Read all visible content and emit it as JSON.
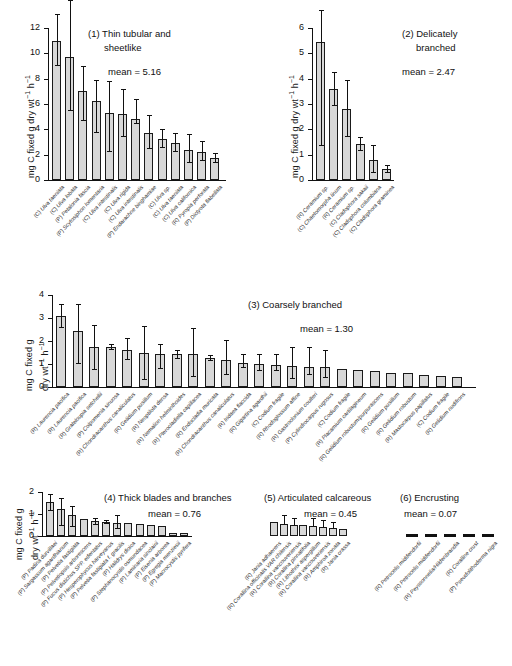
{
  "axis": {
    "ylabel_line1": "mg C fixed g dry wt",
    "ylabel_line2": "mg C fixed g",
    "ylabel_line3": "dry wt",
    "ylabel_full": "mg C fixed g dry wt-1 h-1"
  },
  "chart_data": {
    "type": "bar",
    "ylabel": "mg C fixed g dry wt⁻¹ h⁻¹",
    "xlabel": "",
    "grid": false,
    "legend": "none",
    "panels": [
      {
        "id": 1,
        "title": "(1) Thin tubular and sheetlike",
        "title_lines": [
          "(1) Thin tubular and",
          "sheetlike"
        ],
        "mean_label": "mean = 5.16",
        "mean": 5.16,
        "ylim": [
          0,
          12
        ],
        "yticks": [
          0,
          2,
          4,
          6,
          8,
          10,
          12
        ],
        "categories": [
          "(C) Ulva taeniata",
          "(C) Ulva lobata",
          "(P) Petalonia fascia",
          "(P) Scytosiphon lomentaria",
          "(C) Ulva intestinalis",
          "(C) Ulva rigida",
          "(C) Ulva intestinalis",
          "(P) Endarachne binghamiae",
          "(C) Ulva sp.",
          "(C) Ulva taeniata",
          "(C) Ulva californica",
          "(R) Pyropia perforata",
          "(P) Dictyota flabellata"
        ],
        "values": [
          11.0,
          9.75,
          7.05,
          6.25,
          5.3,
          5.2,
          4.85,
          3.7,
          3.25,
          2.9,
          2.4,
          2.2,
          1.75
        ],
        "err_low": [
          9.1,
          5.5,
          4.75,
          3.8,
          2.3,
          3.5,
          4.5,
          2.5,
          2.6,
          2.3,
          1.45,
          1.55,
          1.45
        ],
        "err_high": [
          13.1,
          14.2,
          9.0,
          7.9,
          7.8,
          7.2,
          6.4,
          5.1,
          4.0,
          3.7,
          3.6,
          3.1,
          2.1
        ]
      },
      {
        "id": 2,
        "title": "(2) Delicately branched",
        "title_lines": [
          "(2) Delicately",
          "branched"
        ],
        "mean_label": "mean = 2.47",
        "mean": 2.47,
        "ylim": [
          0,
          6
        ],
        "yticks": [
          0,
          1,
          2,
          3,
          4,
          5,
          6
        ],
        "categories": [
          "(R) Ceramium sp.",
          "(C) Chaetomorpha linum",
          "(R) Ceramium sp.",
          "(C) Cladophora sakaii",
          "(C) Cladophora columbiana",
          "(C) Cladophora graminea"
        ],
        "values": [
          5.45,
          3.6,
          2.8,
          1.42,
          0.8,
          0.45
        ],
        "err_low": [
          1.4,
          2.95,
          1.75,
          1.2,
          0.3,
          0.32
        ],
        "err_high": [
          6.7,
          4.25,
          3.95,
          1.68,
          1.4,
          0.58
        ]
      },
      {
        "id": 3,
        "title": "(3) Coarsely branched",
        "title_lines": [
          "(3) Coarsely branched"
        ],
        "mean_label": "mean = 1.30",
        "mean": 1.3,
        "ylim": [
          0,
          4
        ],
        "yticks": [
          0,
          1,
          2,
          3,
          4
        ],
        "categories": [
          "(R) Laurencia pacifica",
          "(R) Laurencia pacifica",
          "(R) Grateloupia setchellii",
          "(P) Colpomenia sinuosa",
          "(R) Chondracanthus canaliculatus",
          "(R) Gelidium pusillum",
          "(R) Neoptilota densa",
          "(R) Nemalion helminthoides",
          "(R) Pterocladiella capillacea",
          "(R) Endocladia muricata",
          "(R) Chondracanthus canaliculatus",
          "(R) Iridaea flaccida",
          "(R) Gigartina agardhii",
          "(C) Codium fragile",
          "(R) Rhodoglossum affine",
          "(R) Gastroclonium coulteri",
          "(P) Cylindrocarpus rugosus",
          "(C) Codium fragile",
          "(R) Placamium cartilagineum",
          "(R) Gelidium robustum/purpurascens",
          "(R) Gelidium pusillum",
          "(R) Gelidium robustum",
          "(R) Mastocarpus papillatus",
          "(C) Codium fragile",
          "(R) Gelidium nudifrons"
        ],
        "values": [
          3.1,
          2.42,
          1.75,
          1.75,
          1.62,
          1.5,
          1.45,
          1.45,
          1.42,
          1.28,
          1.18,
          1.05,
          1.0,
          0.95,
          0.9,
          0.88,
          0.85,
          0.78,
          0.72,
          0.7,
          0.62,
          0.6,
          0.52,
          0.48,
          0.42
        ],
        "err_low": [
          2.6,
          1.05,
          0.78,
          1.65,
          1.2,
          0.35,
          0.82,
          1.25,
          0.48,
          1.18,
          0.55,
          0.85,
          0.72,
          0.75,
          0.4,
          0.55,
          0.42,
          0.78,
          0.72,
          0.7,
          0.62,
          0.6,
          0.52,
          0.48,
          0.42
        ],
        "err_high": [
          3.62,
          3.6,
          2.7,
          1.85,
          2.15,
          2.65,
          1.88,
          1.6,
          2.58,
          1.38,
          2.05,
          1.42,
          1.42,
          1.42,
          1.75,
          1.75,
          1.6,
          0.78,
          0.72,
          0.7,
          0.62,
          0.6,
          0.52,
          0.48,
          0.42
        ]
      },
      {
        "id": 4,
        "title": "(4) Thick blades and branches",
        "title_lines": [
          "(4) Thick blades and branches"
        ],
        "mean_label": "mean = 0.76",
        "mean": 0.76,
        "ylim": [
          0,
          2
        ],
        "yticks": [
          0,
          1,
          2
        ],
        "categories": [
          "(P) Padina durvillaei",
          "(P) Sargassum agardhianum",
          "(P) Pelvetia fastigiata",
          "(P) Pelvetiopsis arborescens",
          "(P) Fucus distichus SPP. edentatus",
          "(P) Hesperophycus harveyanus",
          "(P) Pelvetia fastigiata f. gracilis",
          "(P) Halidrys dioica",
          "(P) Stephanocystis osmundacea",
          "(P) Laminaria sinclairii",
          "(P) Eisenia arborea",
          "(P) Egregia menziesii",
          "(P) Macrocystis pyrifera"
        ],
        "values": [
          1.55,
          1.25,
          0.95,
          0.78,
          0.7,
          0.65,
          0.6,
          0.58,
          0.55,
          0.5,
          0.45,
          0.12,
          0.12
        ],
        "err_low": [
          1.2,
          0.5,
          0.45,
          0.78,
          0.55,
          0.58,
          0.35,
          0.58,
          0.55,
          0.5,
          0.45,
          0.12,
          0.12
        ],
        "err_high": [
          1.9,
          1.75,
          1.35,
          0.78,
          0.8,
          0.72,
          0.95,
          0.58,
          0.55,
          0.5,
          0.45,
          0.12,
          0.12
        ]
      },
      {
        "id": 5,
        "title": "(5) Articulated calcareous",
        "title_lines": [
          "(5) Articulated calcareous"
        ],
        "mean_label": "mean = 0.45",
        "mean": 0.45,
        "ylim": [
          0,
          2
        ],
        "yticks": [],
        "categories": [
          "(R) Jania adhaerens",
          "(R) Corallina officinalis VAR chilensis",
          "(R) Corallina vancouveriensis",
          "(R) Corallina pinnatifolia",
          "(R) Lithothrix aspergillum",
          "(R) Corallina vancouveriensis",
          "(R) Amphiroa zonata",
          "(R) Jania crassa"
        ],
        "values": [
          0.62,
          0.55,
          0.5,
          0.48,
          0.45,
          0.42,
          0.38,
          0.32
        ],
        "err_low": [
          0.62,
          0.55,
          0.5,
          0.48,
          0.45,
          0.42,
          0.38,
          0.32
        ],
        "err_high": [
          0.62,
          0.95,
          0.8,
          0.48,
          0.82,
          0.75,
          0.62,
          0.32
        ]
      },
      {
        "id": 6,
        "title": "(6) Encrusting",
        "title_lines": [
          "(6) Encrusting"
        ],
        "mean_label": "mean = 0.07",
        "mean": 0.07,
        "ylim": [
          0,
          2
        ],
        "yticks": [],
        "categories": [
          "(R) Petrocelis middendorfii",
          "(R) Petrocelis middendorfii",
          "(R) Peyssonnelia/Hildenbrandia",
          "(R) Coralline crust",
          "(P) Pseudolithoderma nigra"
        ],
        "values": [
          0.09,
          0.08,
          0.07,
          0.06,
          0.05
        ],
        "err_low": [
          0.09,
          0.08,
          0.07,
          0.06,
          0.05
        ],
        "err_high": [
          0.09,
          0.08,
          0.07,
          0.06,
          0.05
        ]
      }
    ]
  }
}
